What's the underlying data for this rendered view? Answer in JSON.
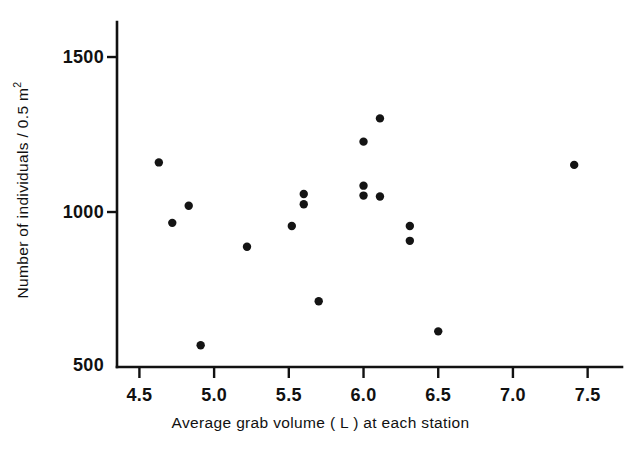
{
  "chart_data": {
    "type": "scatter",
    "title": "",
    "xlabel": "Average grab volume ( L ) at each station",
    "ylabel_prefix": "Number of individuals / 0.5 m",
    "ylabel_superscript": "2",
    "ylabel_full": "Number of individuals / 0.5 m2",
    "xlim": [
      4.35,
      7.75
    ],
    "ylim": [
      500,
      1560
    ],
    "xticks": [
      4.5,
      5.0,
      5.5,
      6.0,
      6.5,
      7.0,
      7.5
    ],
    "xtick_labels": [
      "4.5",
      "5.0",
      "5.5",
      "6.0",
      "6.5",
      "7.0",
      "7.5"
    ],
    "yticks": [
      500,
      1000,
      1500
    ],
    "ytick_labels": [
      "500",
      "1000",
      "1500"
    ],
    "grid": false,
    "legend": null,
    "marker": {
      "shape": "circle",
      "size_px": 7.2,
      "color": "#141414"
    },
    "points": [
      {
        "x": 4.63,
        "y": 1160
      },
      {
        "x": 4.72,
        "y": 965
      },
      {
        "x": 4.83,
        "y": 1020
      },
      {
        "x": 4.91,
        "y": 570
      },
      {
        "x": 5.22,
        "y": 888
      },
      {
        "x": 5.52,
        "y": 955
      },
      {
        "x": 5.6,
        "y": 1058
      },
      {
        "x": 5.6,
        "y": 1025
      },
      {
        "x": 5.7,
        "y": 712
      },
      {
        "x": 6.0,
        "y": 1227
      },
      {
        "x": 6.0,
        "y": 1085
      },
      {
        "x": 6.0,
        "y": 1053
      },
      {
        "x": 6.11,
        "y": 1302
      },
      {
        "x": 6.11,
        "y": 1050
      },
      {
        "x": 6.31,
        "y": 955
      },
      {
        "x": 6.31,
        "y": 907
      },
      {
        "x": 6.5,
        "y": 615
      },
      {
        "x": 7.41,
        "y": 1152
      }
    ]
  },
  "axes_pixels": {
    "x_left_px": 117,
    "x_right_px": 622,
    "y_top_px": 22,
    "y_bottom_px": 367,
    "x_value_at_left": 4.35,
    "x_value_at_right": 7.73,
    "y_value_at_bottom": 500,
    "y_value_at_top": 1613
  }
}
